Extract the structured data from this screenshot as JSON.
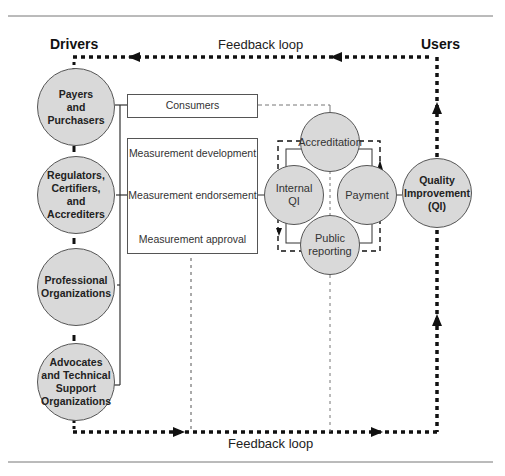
{
  "diagram": {
    "headers": {
      "drivers": "Drivers",
      "users": "Users"
    },
    "feedback_top": "Feedback loop",
    "feedback_bottom": "Feedback loop",
    "drivers": [
      {
        "label": "Payers and Purchasers",
        "lines": [
          "Payers",
          "and",
          "Purchasers"
        ]
      },
      {
        "label": "Regulators, Certifiers, and Accrediters",
        "lines": [
          "Regulators,",
          "Certifiers,",
          "and",
          "Accrediters"
        ]
      },
      {
        "label": "Professional Organizations",
        "lines": [
          "Professional",
          "Organizations"
        ]
      },
      {
        "label": "Advocates and Technical Support Organizations",
        "lines": [
          "Advocates",
          "and Technical",
          "Support",
          "Organizations"
        ]
      }
    ],
    "consumers_box": "Consumers",
    "measurement_steps": [
      "Measurement development",
      "Measurement endorsement",
      "Measurement approval"
    ],
    "uses": {
      "accreditation": "Accreditation",
      "internal_qi": [
        "Internal",
        "QI"
      ],
      "payment": "Payment",
      "public_reporting": [
        "Public",
        "reporting"
      ]
    },
    "quality_improvement": [
      "Quality",
      "Improvement",
      "(QI)"
    ],
    "colors": {
      "circle_fill": "#d9d9d9",
      "line": "#111111",
      "rule": "#666666"
    }
  }
}
